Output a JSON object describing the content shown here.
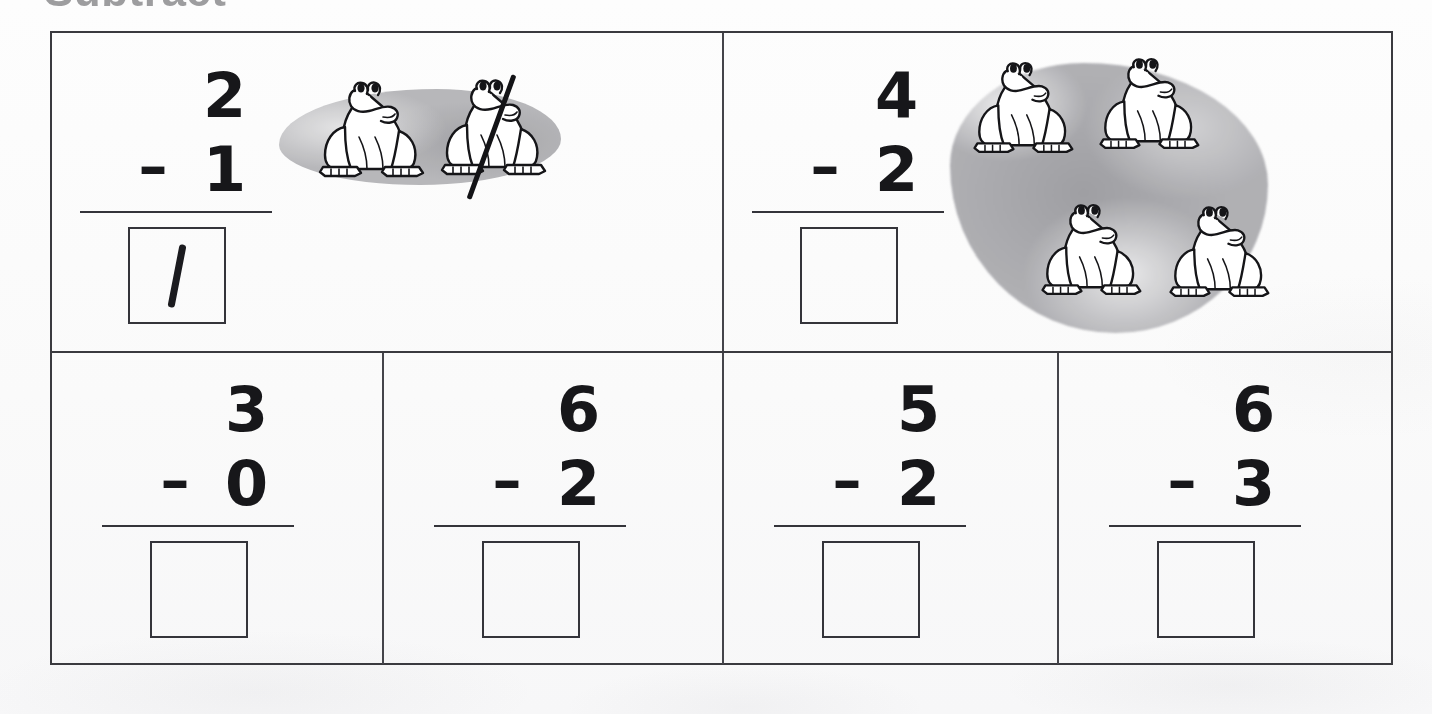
{
  "worksheet": {
    "title": "Subtract",
    "operator": "–",
    "page_background": "#fbfbfb",
    "ink_color": "#17171a",
    "rock_color": "#a9a9ac"
  },
  "problems": [
    {
      "id": "problem-1",
      "position": "top-left",
      "minuend": "2",
      "subtrahend": "1",
      "operator": "–",
      "answer": "1",
      "answer_filled": true,
      "answer_handwritten": true,
      "illustration": {
        "kind": "frogs-on-rock",
        "frog_count": 2,
        "crossed_out_count": 1,
        "arrangement": "row",
        "rock_shape": "wide-flat"
      }
    },
    {
      "id": "problem-2",
      "position": "top-right",
      "minuend": "4",
      "subtrahend": "2",
      "operator": "–",
      "answer": "",
      "answer_filled": false,
      "answer_handwritten": false,
      "illustration": {
        "kind": "frogs-on-rock",
        "frog_count": 4,
        "crossed_out_count": 0,
        "arrangement": "two-by-two",
        "rock_shape": "large-blob"
      }
    },
    {
      "id": "problem-3",
      "position": "bottom-1",
      "minuend": "3",
      "subtrahend": "0",
      "operator": "–",
      "answer": "",
      "answer_filled": false,
      "answer_handwritten": false,
      "illustration": null
    },
    {
      "id": "problem-4",
      "position": "bottom-2",
      "minuend": "6",
      "subtrahend": "2",
      "operator": "–",
      "answer": "",
      "answer_filled": false,
      "answer_handwritten": false,
      "illustration": null
    },
    {
      "id": "problem-5",
      "position": "bottom-3",
      "minuend": "5",
      "subtrahend": "2",
      "operator": "–",
      "answer": "",
      "answer_filled": false,
      "answer_handwritten": false,
      "illustration": null
    },
    {
      "id": "problem-6",
      "position": "bottom-4",
      "minuend": "6",
      "subtrahend": "3",
      "operator": "–",
      "answer": "",
      "answer_filled": false,
      "answer_handwritten": false,
      "illustration": null
    }
  ]
}
